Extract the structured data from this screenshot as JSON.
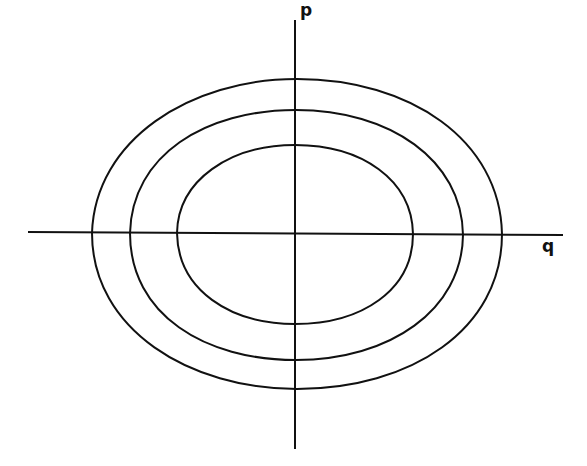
{
  "diagram": {
    "type": "phase-space portrait",
    "axes": {
      "vertical": {
        "label": "p"
      },
      "horizontal": {
        "label": "q"
      }
    },
    "curves": [
      {
        "name": "inner-orbit",
        "cx": 295,
        "cy": 234,
        "rx": 118,
        "ry": 90
      },
      {
        "name": "middle-orbit",
        "cx": 296,
        "cy": 235,
        "rx": 166,
        "ry": 125
      },
      {
        "name": "outer-orbit",
        "cx": 297,
        "cy": 234,
        "rx": 205,
        "ry": 155
      }
    ],
    "colors": {
      "line": "#111111",
      "background": "#ffffff"
    }
  }
}
